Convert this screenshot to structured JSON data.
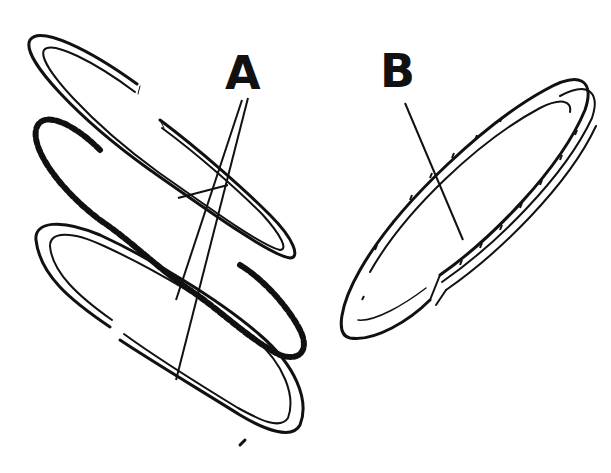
{
  "figure": {
    "labels": [
      {
        "id": "A",
        "text": "A",
        "points_to": "compression rings (two split rings with expander between)"
      },
      {
        "id": "B",
        "text": "B",
        "points_to": "oil control ring"
      }
    ],
    "colors": {
      "ink": "#111111",
      "background": "#ffffff"
    }
  }
}
